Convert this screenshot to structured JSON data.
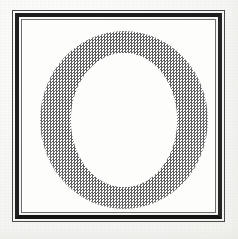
{
  "image": {
    "kind": "scanned-halftone-letterform",
    "canvas_width": 238,
    "canvas_height": 239,
    "page_background_hex": "#f8f8f6",
    "field_background_hex": "#fdfdfc",
    "caption": ""
  },
  "frame": {
    "style": "double-rule rectangle",
    "outer_rule": {
      "left": 12,
      "top": 10,
      "width": 213,
      "height": 212,
      "thickness_px": 1,
      "color_hex": "#4a4a4a"
    },
    "thick_rule": {
      "left": 15,
      "top": 13,
      "width": 207,
      "height": 206,
      "thickness_px": 4,
      "color_hex": "#1d1d1d"
    },
    "inner_hairline": {
      "left": 21,
      "top": 19,
      "width": 195,
      "height": 194,
      "thickness_px": 1,
      "color_hex": "#6e6e6e"
    }
  },
  "glyph": {
    "character": "O",
    "description": "capital letter O drawn as a halftone dot ring",
    "fill_style": "checkerboard halftone screen",
    "dot_pitch_px": 3,
    "dot_color_hex": "#5b5b5b",
    "counter_color_hex": "#fdfdfc",
    "bounds": {
      "left": 40,
      "top": 31,
      "width": 168,
      "height": 178
    },
    "counter_bounds": {
      "left": 71,
      "top": 53,
      "width": 106,
      "height": 134
    },
    "stroke_width_side_px": 31,
    "stroke_width_cap_px": 22
  }
}
